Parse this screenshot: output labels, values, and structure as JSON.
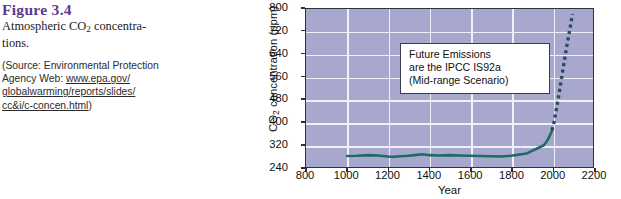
{
  "caption": {
    "figure_number": "Figure 3.4",
    "title_line1": "Atmospheric CO",
    "title_sub": "2",
    "title_line2": " concentra-",
    "title_line3": "tions.",
    "source_prefix": "(Source: Environmental Protection Agency Web: ",
    "source_link1": "www.epa.gov/",
    "source_link2": "globalwarming/reports/slides/",
    "source_link3": "cc&i/c-concen.html",
    "source_suffix": ")"
  },
  "chart_data": {
    "type": "line",
    "title": "",
    "xlabel": "Year",
    "ylabel_pre": "CO",
    "ylabel_sub": "2",
    "ylabel_post": " concentration (ppm)",
    "xlim": [
      800,
      2200
    ],
    "ylim": [
      240,
      800
    ],
    "xticks": [
      800,
      1000,
      1200,
      1400,
      1600,
      1800,
      2000,
      2200
    ],
    "yticks": [
      240,
      320,
      400,
      480,
      560,
      640,
      720,
      800
    ],
    "grid": true,
    "legend": "none",
    "series": [
      {
        "name": "Observed CO2 concentration",
        "style": "solid",
        "color": "#1d6b63",
        "x": [
          1000,
          1050,
          1100,
          1150,
          1200,
          1230,
          1260,
          1300,
          1340,
          1370,
          1400,
          1450,
          1500,
          1550,
          1600,
          1650,
          1700,
          1750,
          1800,
          1830,
          1860,
          1880,
          1900,
          1920,
          1940,
          1960,
          1975,
          1985,
          1995,
          2000
        ],
        "y": [
          279,
          280,
          282,
          281,
          277,
          276,
          278,
          280,
          283,
          285,
          282,
          281,
          282,
          281,
          280,
          279,
          278,
          277,
          280,
          283,
          286,
          289,
          296,
          303,
          310,
          317,
          331,
          345,
          360,
          370
        ]
      },
      {
        "name": "Future emissions (IPCC IS92a mid-range scenario)",
        "style": "dotted",
        "color": "#2c4a5e",
        "x": [
          2000,
          2010,
          2020,
          2030,
          2040,
          2050,
          2060,
          2070,
          2080,
          2090,
          2100
        ],
        "y": [
          370,
          400,
          440,
          480,
          525,
          570,
          615,
          660,
          700,
          740,
          782
        ]
      }
    ],
    "annotation": {
      "line1": "Future Emissions",
      "line2": "are the IPCC IS92a",
      "line3": "(Mid-range Scenario)"
    }
  },
  "colors": {
    "plot_background": "#a8a8cf",
    "gridline": "#f0f0fa",
    "frame": "#2f2f3f",
    "figure_heading": "#5a3a8e",
    "observed_line": "#1d6b63",
    "projection_line": "#2c4a5e"
  }
}
